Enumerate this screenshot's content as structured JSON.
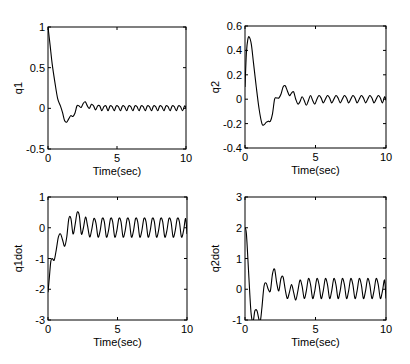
{
  "chart_data": [
    {
      "type": "line",
      "id": "q1",
      "title": "",
      "xlabel": "Time(sec)",
      "ylabel": "q1",
      "xlim": [
        0,
        10
      ],
      "ylim": [
        -0.5,
        1
      ],
      "xticks": [
        0,
        5,
        10
      ],
      "xtick_labels": [
        "0",
        "5",
        "10"
      ],
      "yticks": [
        -0.5,
        0,
        0.5,
        1
      ],
      "ytick_labels": [
        "-0.5",
        "0",
        "0.5",
        "1"
      ],
      "grid": false,
      "series": [
        {
          "name": "q1",
          "x": [
            0,
            0.15,
            0.3,
            0.5,
            0.7,
            0.9,
            1.05,
            1.2,
            1.35,
            1.5,
            1.65,
            1.8,
            1.95,
            2.1,
            2.25,
            2.4,
            2.55,
            2.7,
            2.85,
            3.0,
            3.15,
            3.3,
            3.45,
            3.6,
            3.75,
            3.9,
            4.05,
            4.2,
            4.35,
            4.5,
            4.65,
            4.8,
            4.95,
            5.1,
            5.25,
            5.4,
            5.55,
            5.7,
            5.85,
            6.0,
            6.15,
            6.3,
            6.45,
            6.6,
            6.75,
            6.9,
            7.05,
            7.2,
            7.35,
            7.5,
            7.65,
            7.8,
            7.95,
            8.1,
            8.25,
            8.4,
            8.55,
            8.7,
            8.85,
            9.0,
            9.15,
            9.3,
            9.45,
            9.6,
            9.75,
            9.9,
            10.0
          ],
          "y": [
            1.0,
            0.78,
            0.55,
            0.32,
            0.12,
            0.03,
            -0.05,
            -0.15,
            -0.17,
            -0.13,
            -0.09,
            -0.1,
            -0.06,
            0.03,
            0.03,
            0.01,
            0.06,
            0.08,
            0.03,
            0.0,
            0.05,
            0.03,
            -0.02,
            0.03,
            0.03,
            -0.03,
            0.02,
            0.03,
            -0.03,
            0.03,
            0.02,
            -0.03,
            0.03,
            0.02,
            -0.03,
            0.03,
            0.02,
            -0.03,
            0.03,
            0.02,
            -0.03,
            0.03,
            0.02,
            -0.03,
            0.03,
            0.02,
            -0.03,
            0.03,
            0.02,
            -0.03,
            0.03,
            0.02,
            -0.03,
            0.03,
            0.02,
            -0.03,
            0.03,
            0.02,
            -0.03,
            0.03,
            0.02,
            -0.03,
            0.03,
            0.02,
            -0.03,
            0.03,
            0.0
          ]
        }
      ]
    },
    {
      "type": "line",
      "id": "q2",
      "title": "",
      "xlabel": "Time(sec)",
      "ylabel": "q2",
      "xlim": [
        0,
        10
      ],
      "ylim": [
        -0.4,
        0.6
      ],
      "xticks": [
        0,
        5,
        10
      ],
      "xtick_labels": [
        "0",
        "5",
        "10"
      ],
      "yticks": [
        -0.4,
        -0.2,
        0,
        0.2,
        0.4,
        0.6
      ],
      "ytick_labels": [
        "-0.4",
        "-0.2",
        "0",
        "0.2",
        "0.4",
        "0.6"
      ],
      "grid": false,
      "series": [
        {
          "name": "q2",
          "x": [
            0,
            0.1,
            0.2,
            0.3,
            0.45,
            0.6,
            0.8,
            1.0,
            1.2,
            1.35,
            1.5,
            1.65,
            1.8,
            1.95,
            2.1,
            2.25,
            2.4,
            2.55,
            2.7,
            2.85,
            3.0,
            3.15,
            3.3,
            3.45,
            3.6,
            3.75,
            3.9,
            4.05,
            4.2,
            4.35,
            4.5,
            4.65,
            4.8,
            4.95,
            5.1,
            5.25,
            5.4,
            5.55,
            5.7,
            5.85,
            6.0,
            6.15,
            6.3,
            6.45,
            6.6,
            6.75,
            6.9,
            7.05,
            7.2,
            7.35,
            7.5,
            7.65,
            7.8,
            7.95,
            8.1,
            8.25,
            8.4,
            8.55,
            8.7,
            8.85,
            9.0,
            9.15,
            9.3,
            9.45,
            9.6,
            9.75,
            9.9,
            10.0
          ],
          "y": [
            0.1,
            0.38,
            0.49,
            0.51,
            0.45,
            0.3,
            0.1,
            -0.08,
            -0.2,
            -0.21,
            -0.19,
            -0.18,
            -0.18,
            -0.12,
            0.0,
            0.01,
            0.01,
            0.04,
            0.1,
            0.11,
            0.07,
            0.03,
            0.05,
            0.06,
            0.0,
            -0.04,
            -0.02,
            0.02,
            -0.01,
            -0.05,
            -0.01,
            0.03,
            -0.01,
            -0.04,
            0.0,
            0.03,
            0.01,
            -0.03,
            0.0,
            0.03,
            0.01,
            -0.03,
            0.0,
            0.03,
            0.01,
            -0.03,
            0.0,
            0.03,
            0.01,
            -0.03,
            0.0,
            0.03,
            0.01,
            -0.03,
            0.0,
            0.03,
            0.01,
            -0.03,
            0.0,
            0.03,
            0.01,
            -0.03,
            0.0,
            0.03,
            0.01,
            -0.03,
            0.02,
            -0.01
          ]
        }
      ]
    },
    {
      "type": "line",
      "id": "q1dot",
      "title": "",
      "xlabel": "Time(sec)",
      "ylabel": "q1dot",
      "xlim": [
        0,
        10
      ],
      "ylim": [
        -3,
        1
      ],
      "xticks": [
        0,
        5,
        10
      ],
      "xtick_labels": [
        "0",
        "5",
        "10"
      ],
      "yticks": [
        -3,
        -2,
        -1,
        0,
        1
      ],
      "ytick_labels": [
        "-3",
        "-2",
        "-1",
        "0",
        "1"
      ],
      "grid": false,
      "series": [
        {
          "name": "q1dot",
          "x": [
            0,
            0.1,
            0.2,
            0.3,
            0.45,
            0.6,
            0.75,
            0.9,
            1.05,
            1.2,
            1.35,
            1.5,
            1.65,
            1.8,
            1.95,
            2.1,
            2.25,
            2.4,
            2.55,
            2.7,
            2.85,
            3.0,
            3.15,
            3.3,
            3.45,
            3.6,
            3.75,
            3.9,
            4.05,
            4.2,
            4.35,
            4.5,
            4.65,
            4.8,
            4.95,
            5.1,
            5.25,
            5.4,
            5.55,
            5.7,
            5.85,
            6.0,
            6.15,
            6.3,
            6.45,
            6.6,
            6.75,
            6.9,
            7.05,
            7.2,
            7.35,
            7.5,
            7.65,
            7.8,
            7.95,
            8.1,
            8.25,
            8.4,
            8.55,
            8.7,
            8.85,
            9.0,
            9.15,
            9.3,
            9.45,
            9.6,
            9.75,
            9.9,
            10.0
          ],
          "y": [
            -2.1,
            -1.6,
            -1.1,
            -1.0,
            -1.05,
            -0.7,
            -0.3,
            -0.2,
            -0.4,
            -0.6,
            -0.3,
            0.3,
            0.3,
            -0.2,
            0.1,
            0.5,
            0.4,
            -0.2,
            0.0,
            0.35,
            0.05,
            -0.3,
            -0.05,
            0.3,
            0.15,
            -0.3,
            -0.1,
            0.3,
            0.2,
            -0.3,
            -0.1,
            0.3,
            0.2,
            -0.3,
            -0.1,
            0.3,
            0.2,
            -0.3,
            -0.1,
            0.3,
            0.2,
            -0.3,
            -0.1,
            0.3,
            0.2,
            -0.3,
            -0.1,
            0.3,
            0.2,
            -0.3,
            -0.1,
            0.3,
            0.2,
            -0.3,
            -0.1,
            0.3,
            0.2,
            -0.3,
            -0.1,
            0.3,
            0.2,
            -0.3,
            -0.1,
            0.3,
            0.2,
            -0.3,
            -0.1,
            0.3,
            -0.2
          ]
        }
      ]
    },
    {
      "type": "line",
      "id": "q2dot",
      "title": "",
      "xlabel": "Time(sec)",
      "ylabel": "q2dot",
      "xlim": [
        0,
        10
      ],
      "ylim": [
        -1,
        3
      ],
      "xticks": [
        0,
        5,
        10
      ],
      "xtick_labels": [
        "0",
        "5",
        "10"
      ],
      "yticks": [
        -1,
        0,
        1,
        2,
        3
      ],
      "ytick_labels": [
        "-1",
        "0",
        "1",
        "2",
        "3"
      ],
      "grid": false,
      "series": [
        {
          "name": "q2dot",
          "x": [
            0,
            0.1,
            0.25,
            0.4,
            0.5,
            0.6,
            0.7,
            0.85,
            1.0,
            1.1,
            1.2,
            1.35,
            1.5,
            1.65,
            1.8,
            1.95,
            2.1,
            2.25,
            2.4,
            2.55,
            2.7,
            2.85,
            3.0,
            3.15,
            3.3,
            3.45,
            3.6,
            3.75,
            3.9,
            4.05,
            4.2,
            4.35,
            4.5,
            4.65,
            4.8,
            4.95,
            5.1,
            5.25,
            5.4,
            5.55,
            5.7,
            5.85,
            6.0,
            6.15,
            6.3,
            6.45,
            6.6,
            6.75,
            6.9,
            7.05,
            7.2,
            7.35,
            7.5,
            7.65,
            7.8,
            7.95,
            8.1,
            8.25,
            8.4,
            8.55,
            8.7,
            8.85,
            9.0,
            9.15,
            9.3,
            9.45,
            9.6,
            9.75,
            9.9,
            10.0
          ],
          "y": [
            2.0,
            1.8,
            0.6,
            -0.6,
            -1.0,
            -1.0,
            -0.7,
            -0.7,
            -1.0,
            -1.0,
            -0.6,
            0.1,
            0.2,
            0.0,
            -0.05,
            0.5,
            0.65,
            0.2,
            -0.05,
            0.35,
            0.4,
            0.0,
            -0.3,
            -0.1,
            0.15,
            -0.1,
            -0.35,
            -0.05,
            0.3,
            0.1,
            -0.3,
            -0.05,
            0.35,
            0.15,
            -0.3,
            -0.05,
            0.35,
            0.15,
            -0.3,
            -0.05,
            0.35,
            0.15,
            -0.3,
            -0.05,
            0.35,
            0.15,
            -0.3,
            -0.05,
            0.35,
            0.15,
            -0.3,
            -0.05,
            0.35,
            0.15,
            -0.3,
            -0.05,
            0.35,
            0.15,
            -0.3,
            -0.05,
            0.35,
            0.15,
            -0.3,
            -0.05,
            0.35,
            0.15,
            -0.3,
            -0.05,
            0.3,
            -0.3
          ]
        }
      ]
    }
  ]
}
